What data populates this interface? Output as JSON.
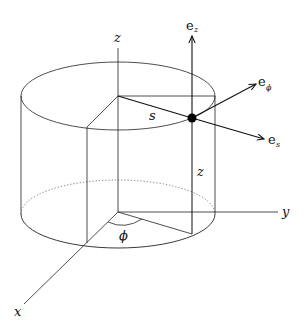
{
  "diagram": {
    "axes": {
      "x": "x",
      "y": "y",
      "z": "z"
    },
    "quantities": {
      "radial": "s",
      "height": "z",
      "angle": "ϕ"
    },
    "unit_vectors": [
      {
        "base": "e",
        "sub": "z"
      },
      {
        "base": "e",
        "sub": "ϕ"
      },
      {
        "base": "e",
        "sub": "s"
      }
    ],
    "colors": {
      "line": "#111111",
      "background": "#ffffff"
    }
  }
}
